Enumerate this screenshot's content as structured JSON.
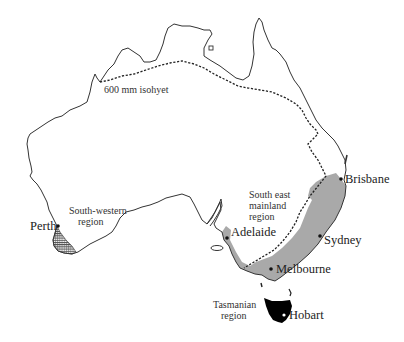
{
  "map": {
    "title": "Australia rainfall regions map",
    "isohyet_label": "600 mm isohyet",
    "colors": {
      "background": "#ffffff",
      "coastline": "#333333",
      "south_east_region_fill": "#a8a8a8",
      "tasmania_fill": "#000000",
      "south_western_hatch": "#444444"
    },
    "regions": [
      {
        "id": "south-western",
        "line1": "South-western",
        "line2": "region"
      },
      {
        "id": "south-east",
        "line1": "South east",
        "line2": "mainland",
        "line3": "region"
      },
      {
        "id": "tasmanian",
        "line1": "Tasmanian",
        "line2": "region"
      }
    ],
    "cities": [
      {
        "name": "Perth"
      },
      {
        "name": "Adelaide"
      },
      {
        "name": "Melbourne"
      },
      {
        "name": "Sydney"
      },
      {
        "name": "Brisbane"
      },
      {
        "name": "Hobart"
      }
    ]
  }
}
